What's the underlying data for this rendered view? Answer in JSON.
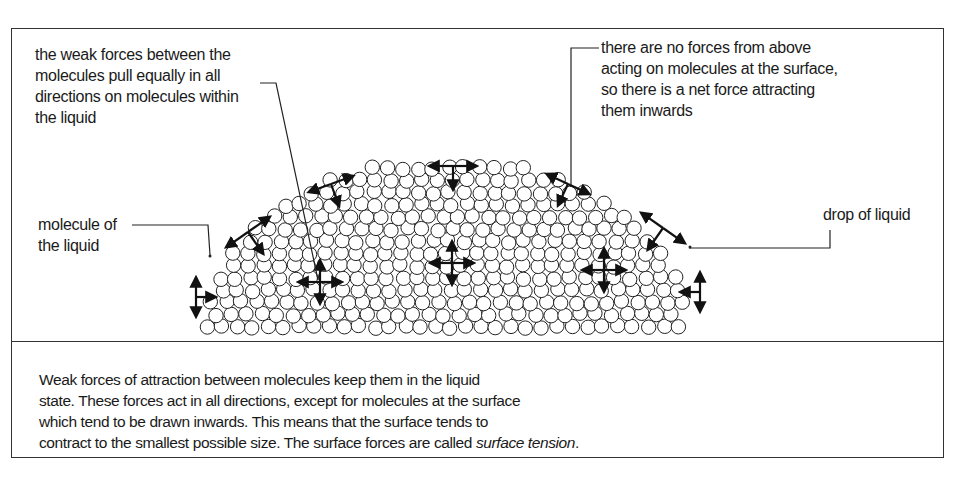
{
  "labels": {
    "inner_forces": [
      "the weak forces between the",
      "molecules pull equally in all",
      "directions on molecules within",
      "the liquid"
    ],
    "surface_forces": [
      "there are no forces from above",
      "acting on molecules at the surface,",
      "so there is a net force attracting",
      "them inwards"
    ],
    "molecule": [
      "molecule of",
      "the liquid"
    ],
    "drop": "drop of liquid"
  },
  "caption": {
    "lines": [
      "Weak forces of attraction between molecules keep them in the liquid",
      "state. These forces act in all directions, except for molecules at the surface",
      "which tend to be drawn inwards. This means that the surface tends to",
      "contract to the smallest possible size. The surface forces are called "
    ],
    "term": "surface tension",
    "end": "."
  },
  "colors": {
    "ink": "#1a1a1a",
    "frame": "#333333"
  }
}
